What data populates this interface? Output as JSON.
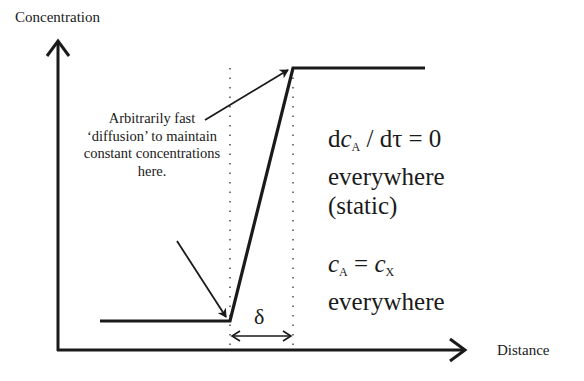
{
  "diagram": {
    "axes": {
      "y_label": "Concentration",
      "x_label": "Distance"
    },
    "annotation": {
      "lines": [
        "Arbitrarily fast",
        "‘diffusion’ to maintain",
        "constant concentrations",
        "here."
      ]
    },
    "equation1": {
      "lhs_d1": "d",
      "lhs_var": "c",
      "lhs_sub": "A",
      "slash": " / dτ = 0",
      "line2": "everywhere",
      "line3": "(static)"
    },
    "equation2": {
      "var1": "c",
      "sub1": "A",
      "eq": " = ",
      "var2": "c",
      "sub2": "X",
      "line2": "everywhere"
    },
    "delta_label": "δ",
    "profile": {
      "low_level": "low",
      "high_level": "high",
      "transition_width": "δ"
    }
  }
}
